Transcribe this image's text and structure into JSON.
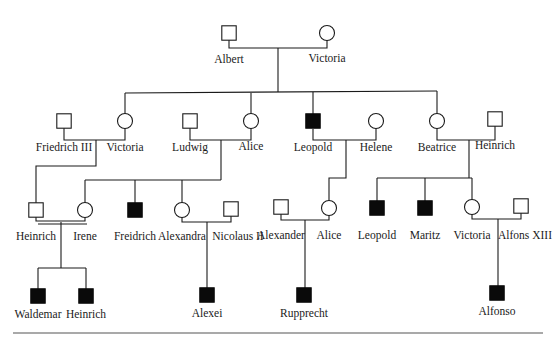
{
  "diagram": {
    "type": "pedigree",
    "legend_meaning": {
      "filled_square": "affected male",
      "open_square": "unaffected male",
      "open_circle": "female"
    },
    "colors": {
      "line": "#1a1a1a",
      "affected": "#0a0a0a",
      "unaffected_fill": "#ffffff",
      "rule": "#555555"
    },
    "individuals": [
      {
        "id": "albert",
        "name": "Albert",
        "sex": "male",
        "affected": false,
        "x": 229,
        "y": 33,
        "lx": 229,
        "ly": 63
      },
      {
        "id": "victoria_q",
        "name": "Victoria",
        "sex": "female",
        "affected": false,
        "x": 327,
        "y": 33,
        "lx": 327,
        "ly": 62
      },
      {
        "id": "friedrich3",
        "name": "Friedrich III",
        "sex": "male",
        "affected": false,
        "x": 64,
        "y": 121,
        "lx": 64,
        "ly": 151
      },
      {
        "id": "victoria_p",
        "name": "Victoria",
        "sex": "female",
        "affected": false,
        "x": 125,
        "y": 121,
        "lx": 125,
        "ly": 151
      },
      {
        "id": "ludwig",
        "name": "Ludwig",
        "sex": "male",
        "affected": false,
        "x": 190,
        "y": 121,
        "lx": 190,
        "ly": 151
      },
      {
        "id": "alice_p",
        "name": "Alice",
        "sex": "female",
        "affected": false,
        "x": 251,
        "y": 121,
        "lx": 251,
        "ly": 150
      },
      {
        "id": "leopold_p",
        "name": "Leopold",
        "sex": "male",
        "affected": true,
        "x": 313,
        "y": 121,
        "lx": 313,
        "ly": 151
      },
      {
        "id": "helene",
        "name": "Helene",
        "sex": "female",
        "affected": false,
        "x": 376,
        "y": 121,
        "lx": 376,
        "ly": 151
      },
      {
        "id": "beatrice",
        "name": "Beatrice",
        "sex": "female",
        "affected": false,
        "x": 437,
        "y": 121,
        "lx": 437,
        "ly": 151
      },
      {
        "id": "heinrich_b",
        "name": "Heinrich",
        "sex": "male",
        "affected": false,
        "x": 495,
        "y": 119,
        "lx": 495,
        "ly": 149
      },
      {
        "id": "heinrich_p",
        "name": "Heinrich",
        "sex": "male",
        "affected": false,
        "x": 36,
        "y": 210,
        "lx": 36,
        "ly": 240
      },
      {
        "id": "irene",
        "name": "Irene",
        "sex": "female",
        "affected": false,
        "x": 85,
        "y": 210,
        "lx": 85,
        "ly": 240
      },
      {
        "id": "freidrich",
        "name": "Freidrich",
        "sex": "male",
        "affected": true,
        "x": 135,
        "y": 210,
        "lx": 135,
        "ly": 240
      },
      {
        "id": "alexandra",
        "name": "Alexandra",
        "sex": "female",
        "affected": false,
        "x": 182,
        "y": 210,
        "lx": 182,
        "ly": 240
      },
      {
        "id": "nicolaus",
        "name": "Nicolaus II",
        "sex": "male",
        "affected": false,
        "x": 231,
        "y": 209,
        "lx": 238,
        "ly": 240
      },
      {
        "id": "alexander",
        "name": "Alexander",
        "sex": "male",
        "affected": false,
        "x": 281,
        "y": 207,
        "lx": 281,
        "ly": 239
      },
      {
        "id": "alice_g",
        "name": "Alice",
        "sex": "female",
        "affected": false,
        "x": 329,
        "y": 208,
        "lx": 329,
        "ly": 239
      },
      {
        "id": "leopold_g",
        "name": "Leopold",
        "sex": "male",
        "affected": true,
        "x": 377,
        "y": 208,
        "lx": 377,
        "ly": 239
      },
      {
        "id": "maritz",
        "name": "Maritz",
        "sex": "male",
        "affected": true,
        "x": 425,
        "y": 208,
        "lx": 425,
        "ly": 239
      },
      {
        "id": "victoria_e",
        "name": "Victoria",
        "sex": "female",
        "affected": false,
        "x": 472,
        "y": 207,
        "lx": 472,
        "ly": 239
      },
      {
        "id": "alfons",
        "name": "Alfons XIII",
        "sex": "male",
        "affected": false,
        "x": 521,
        "y": 206,
        "lx": 525,
        "ly": 239
      },
      {
        "id": "waldemar",
        "name": "Waldemar",
        "sex": "male",
        "affected": true,
        "x": 38,
        "y": 296,
        "lx": 38,
        "ly": 318
      },
      {
        "id": "heinrich_c",
        "name": "Heinrich",
        "sex": "male",
        "affected": true,
        "x": 86,
        "y": 296,
        "lx": 86,
        "ly": 318
      },
      {
        "id": "alexei",
        "name": "Alexei",
        "sex": "male",
        "affected": true,
        "x": 207,
        "y": 295,
        "lx": 207,
        "ly": 317
      },
      {
        "id": "rupprecht",
        "name": "Rupprecht",
        "sex": "male",
        "affected": true,
        "x": 304,
        "y": 295,
        "lx": 304,
        "ly": 317
      },
      {
        "id": "alfonso",
        "name": "Alfonso",
        "sex": "male",
        "affected": true,
        "x": 497,
        "y": 293,
        "lx": 497,
        "ly": 315
      }
    ],
    "lines": [
      {
        "id": "couple-albert-victoria",
        "points": [
          [
            229,
            40
          ],
          [
            229,
            48
          ],
          [
            327,
            48
          ],
          [
            327,
            40
          ]
        ]
      },
      {
        "id": "descent-albert-victoria",
        "points": [
          [
            278,
            48
          ],
          [
            278,
            92
          ]
        ]
      },
      {
        "id": "sibship-gen2",
        "points": [
          [
            125,
            93
          ],
          [
            437,
            91
          ]
        ]
      },
      {
        "id": "drop-victoria",
        "points": [
          [
            125,
            93
          ],
          [
            125,
            114
          ]
        ]
      },
      {
        "id": "drop-alice",
        "points": [
          [
            251,
            93
          ],
          [
            251,
            114
          ]
        ]
      },
      {
        "id": "drop-leopold",
        "points": [
          [
            313,
            92
          ],
          [
            313,
            114
          ]
        ]
      },
      {
        "id": "drop-beatrice",
        "points": [
          [
            437,
            91
          ],
          [
            437,
            114
          ]
        ]
      },
      {
        "id": "couple-friedrich-victoria",
        "points": [
          [
            64,
            128
          ],
          [
            64,
            140
          ],
          [
            125,
            140
          ],
          [
            125,
            128
          ]
        ]
      },
      {
        "id": "descent-friedrich-victoria",
        "points": [
          [
            96,
            140
          ],
          [
            96,
            166
          ],
          [
            36,
            166
          ],
          [
            36,
            203
          ]
        ]
      },
      {
        "id": "couple-ludwig-alice",
        "points": [
          [
            190,
            128
          ],
          [
            190,
            140
          ],
          [
            251,
            140
          ],
          [
            251,
            128
          ]
        ]
      },
      {
        "id": "descent-ludwig-alice",
        "points": [
          [
            221,
            140
          ],
          [
            221,
            180
          ]
        ]
      },
      {
        "id": "sibship-ludwig-alice",
        "points": [
          [
            85,
            180
          ],
          [
            221,
            180
          ]
        ]
      },
      {
        "id": "drop-irene",
        "points": [
          [
            85,
            180
          ],
          [
            85,
            203
          ]
        ]
      },
      {
        "id": "drop-freidrich",
        "points": [
          [
            135,
            180
          ],
          [
            135,
            203
          ]
        ]
      },
      {
        "id": "drop-alexandra",
        "points": [
          [
            182,
            180
          ],
          [
            182,
            203
          ]
        ]
      },
      {
        "id": "couple-leopold-helene",
        "points": [
          [
            313,
            129
          ],
          [
            313,
            140
          ],
          [
            376,
            140
          ],
          [
            376,
            128
          ]
        ]
      },
      {
        "id": "descent-leopold-helene",
        "points": [
          [
            346,
            140
          ],
          [
            346,
            178
          ],
          [
            329,
            178
          ],
          [
            329,
            201
          ]
        ]
      },
      {
        "id": "couple-beatrice-heinrich",
        "points": [
          [
            437,
            128
          ],
          [
            437,
            140
          ],
          [
            495,
            140
          ],
          [
            495,
            126
          ]
        ]
      },
      {
        "id": "descent-beatrice-heinrich",
        "points": [
          [
            469,
            140
          ],
          [
            469,
            178
          ]
        ]
      },
      {
        "id": "sibship-beatrice-heinrich",
        "points": [
          [
            377,
            178
          ],
          [
            472,
            178
          ]
        ]
      },
      {
        "id": "drop-leopold-g",
        "points": [
          [
            377,
            178
          ],
          [
            377,
            201
          ]
        ]
      },
      {
        "id": "drop-maritz",
        "points": [
          [
            425,
            178
          ],
          [
            425,
            201
          ]
        ]
      },
      {
        "id": "drop-victoria-e",
        "points": [
          [
            472,
            178
          ],
          [
            472,
            200
          ]
        ]
      },
      {
        "id": "couple-heinrich-irene-a",
        "points": [
          [
            36,
            217
          ],
          [
            36,
            221
          ],
          [
            85,
            221
          ],
          [
            85,
            217
          ]
        ]
      },
      {
        "id": "couple-heinrich-irene-b",
        "points": [
          [
            38,
            224
          ],
          [
            87,
            224
          ]
        ]
      },
      {
        "id": "descent-heinrich-irene",
        "points": [
          [
            61,
            222
          ],
          [
            61,
            268
          ]
        ]
      },
      {
        "id": "sibship-heinrich-irene",
        "points": [
          [
            38,
            268
          ],
          [
            86,
            268
          ]
        ]
      },
      {
        "id": "drop-waldemar",
        "points": [
          [
            38,
            268
          ],
          [
            38,
            289
          ]
        ]
      },
      {
        "id": "drop-heinrich-c",
        "points": [
          [
            86,
            268
          ],
          [
            86,
            289
          ]
        ]
      },
      {
        "id": "couple-alexandra-nicolaus",
        "points": [
          [
            182,
            217
          ],
          [
            182,
            222
          ],
          [
            231,
            222
          ],
          [
            231,
            216
          ]
        ]
      },
      {
        "id": "descent-alexandra-nicolaus",
        "points": [
          [
            207,
            222
          ],
          [
            207,
            288
          ]
        ]
      },
      {
        "id": "couple-alexander-alice",
        "points": [
          [
            281,
            214
          ],
          [
            281,
            220
          ],
          [
            329,
            220
          ],
          [
            329,
            215
          ]
        ]
      },
      {
        "id": "descent-alexander-alice",
        "points": [
          [
            305,
            220
          ],
          [
            305,
            288
          ]
        ]
      },
      {
        "id": "couple-victoria-alfons",
        "points": [
          [
            472,
            214
          ],
          [
            472,
            219
          ],
          [
            521,
            219
          ],
          [
            521,
            213
          ]
        ]
      },
      {
        "id": "descent-victoria-alfons",
        "points": [
          [
            498,
            219
          ],
          [
            498,
            286
          ]
        ]
      }
    ],
    "rule": {
      "x1": 13,
      "y1": 333,
      "x2": 543,
      "y2": 333
    }
  }
}
